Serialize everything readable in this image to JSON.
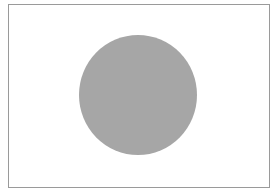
{
  "image": {
    "subject": "flag with centered disc",
    "background_color": "#ffffff",
    "border_color": "#9a9a9a",
    "disc_color": "#a6a6a6"
  },
  "shapes": {
    "frame": {
      "x": 8,
      "y": 4,
      "width": 262,
      "height": 184
    },
    "disc": {
      "cx": 138,
      "cy": 95,
      "rx": 59,
      "ry": 60
    }
  }
}
